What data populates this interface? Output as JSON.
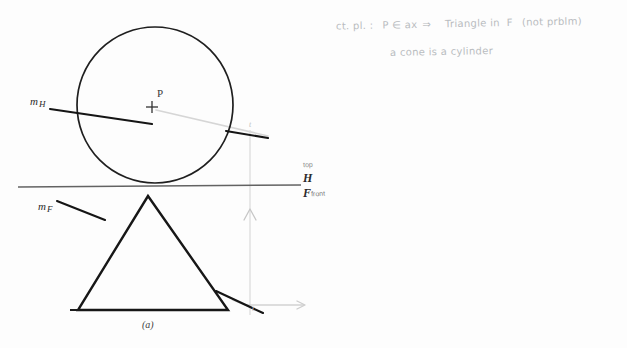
{
  "figure": {
    "caption": "(a)",
    "background_color": "#fdfdfd",
    "ink_color": "#1a1a1a",
    "faint_ink_color": "#c2c2c2",
    "pencil_color": "#b9bcc0"
  },
  "annotation": {
    "line1": {
      "prefix": "ct. pl. :",
      "condition": "P ∈ ax",
      "arrow": "⇒",
      "result": "Triangle in  F",
      "parenthetical": "(not prblm)"
    },
    "line2": {
      "text": "a cone is a cylinder"
    }
  },
  "labels": {
    "point_p": "P",
    "m_horizontal": {
      "base": "m",
      "sub": "H"
    },
    "m_frontal": {
      "base": "m",
      "sub": "F"
    },
    "plane_h": "H",
    "plane_f": "F",
    "view_top": "top",
    "view_front": "front",
    "tangent_mark_top": "t",
    "tangent_mark_bottom": "t"
  },
  "geometry": {
    "circle": {
      "name": "top-view-circle",
      "cx": 155,
      "cy": 105,
      "r": 78,
      "stroke": "#1d1d1d",
      "stroke_width": 1.6
    },
    "point_p": {
      "name": "center-point-p",
      "x": 152,
      "y": 107,
      "tick": 5,
      "stroke": "#303030"
    },
    "triangle": {
      "name": "front-view-triangle",
      "apex": {
        "x": 148,
        "y": 196
      },
      "left": {
        "x": 78,
        "y": 310
      },
      "right": {
        "x": 228,
        "y": 310
      },
      "stroke": "#161616",
      "stroke_width": 2.4
    },
    "ground_line": {
      "name": "hf-fold-line",
      "x1": 18,
      "y1": 187,
      "x2": 301,
      "y2": 185,
      "stroke": "#5e5e5e",
      "stroke_width": 1.4
    },
    "m_h_trace": {
      "name": "m-h-trace-line",
      "x1": 52,
      "y1": 110,
      "x2": 150,
      "y2": 124,
      "stroke": "#141414",
      "stroke_width": 2.0
    },
    "m_h_trace_right": {
      "name": "m-h-trace-line-right",
      "x1": 228,
      "y1": 132,
      "x2": 265,
      "y2": 138,
      "stroke": "#141414",
      "stroke_width": 2.0
    },
    "m_f_trace": {
      "name": "m-f-trace-line",
      "x1": 58,
      "y1": 202,
      "x2": 104,
      "y2": 219,
      "stroke": "#141414",
      "stroke_width": 2.0
    },
    "m_f_trace_right": {
      "name": "m-f-trace-line-right",
      "x1": 218,
      "y1": 292,
      "x2": 262,
      "y2": 312,
      "stroke": "#141414",
      "stroke_width": 2.0
    },
    "ray_from_p": {
      "name": "light-ray-from-p",
      "x1": 156,
      "y1": 110,
      "x2": 268,
      "y2": 136,
      "stroke": "#d2d2d2",
      "stroke_width": 1.6
    },
    "projector": {
      "name": "vertical-projector",
      "x": 250,
      "y1": 132,
      "y2": 312,
      "stroke": "#dcdcdc",
      "stroke_width": 1.3
    },
    "projector_arrow": {
      "name": "projector-up-arrow",
      "x": 250,
      "y": 212,
      "stroke": "#c4c4c4"
    },
    "axis_arrow": {
      "name": "horizontal-axis-arrow",
      "x1": 248,
      "y1": 305,
      "x2": 306,
      "y2": 305,
      "stroke": "#cfcfcf",
      "stroke_width": 1.3
    }
  }
}
